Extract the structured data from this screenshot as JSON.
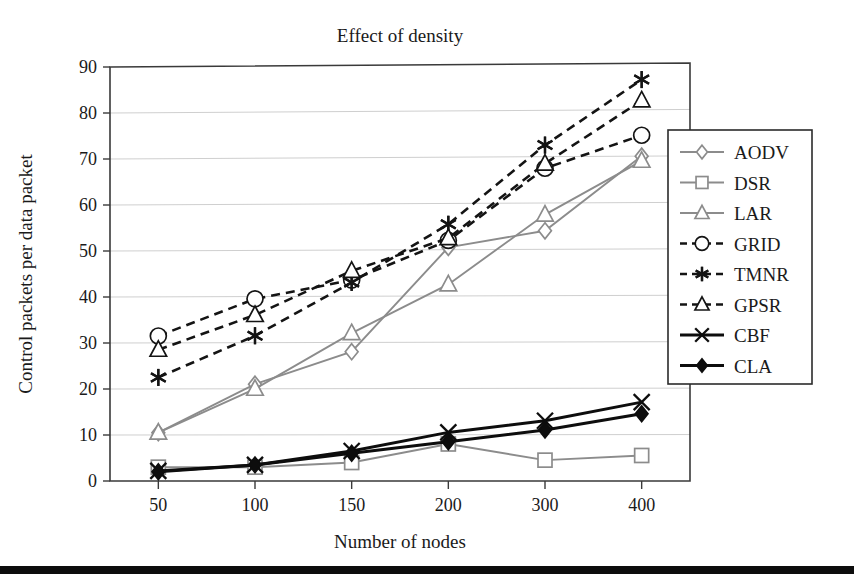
{
  "chart_data": {
    "type": "line",
    "title": "Effect of density",
    "xlabel": "Number of nodes",
    "ylabel": "Control packets per data packet",
    "categories": [
      "50",
      "100",
      "150",
      "200",
      "300",
      "400"
    ],
    "x": [
      50,
      100,
      150,
      200,
      300,
      400
    ],
    "ylim": [
      0,
      90
    ],
    "yticks": [
      "0",
      "10",
      "20",
      "30",
      "40",
      "50",
      "60",
      "70",
      "80",
      "90"
    ],
    "ytick_values": [
      0,
      10,
      20,
      30,
      40,
      50,
      60,
      70,
      80,
      90
    ],
    "grid": "horizontal",
    "legend_position": "right",
    "series": [
      {
        "name": "AODV",
        "values": [
          10.5,
          21.0,
          28.0,
          50.5,
          54.0,
          70.0
        ],
        "marker": "diamond-open",
        "line": "solid",
        "color": "#8c8c8c"
      },
      {
        "name": "DSR",
        "values": [
          3.0,
          3.0,
          4.0,
          8.0,
          4.5,
          5.5
        ],
        "marker": "square-open",
        "line": "solid",
        "color": "#8c8c8c"
      },
      {
        "name": "LAR",
        "values": [
          10.5,
          20.0,
          32.0,
          42.5,
          57.5,
          69.0
        ],
        "marker": "triangle-open",
        "line": "solid",
        "color": "#8c8c8c"
      },
      {
        "name": "GRID",
        "values": [
          31.5,
          39.5,
          43.5,
          52.0,
          67.5,
          74.5
        ],
        "marker": "circle-open",
        "line": "dashed",
        "color": "#141414"
      },
      {
        "name": "TMNR",
        "values": [
          22.5,
          31.5,
          43.0,
          55.5,
          72.5,
          86.5
        ],
        "marker": "asterisk",
        "line": "dashed",
        "color": "#141414"
      },
      {
        "name": "GPSR",
        "values": [
          28.5,
          36.0,
          45.5,
          52.5,
          68.5,
          82.0
        ],
        "marker": "triangle-open",
        "line": "dashed",
        "color": "#141414"
      },
      {
        "name": "CBF",
        "values": [
          2.2,
          3.5,
          6.5,
          10.5,
          13.0,
          17.0
        ],
        "marker": "x-cross",
        "line": "solid",
        "color": "#0d0d0d"
      },
      {
        "name": "CLA",
        "values": [
          2.0,
          3.5,
          6.0,
          8.5,
          11.0,
          14.5
        ],
        "marker": "diamond-filled",
        "line": "solid",
        "color": "#0d0d0d"
      }
    ]
  },
  "legend": {
    "items": [
      {
        "label": "AODV"
      },
      {
        "label": "DSR"
      },
      {
        "label": "LAR"
      },
      {
        "label": "GRID"
      },
      {
        "label": "TMNR"
      },
      {
        "label": "GPSR"
      },
      {
        "label": "CBF"
      },
      {
        "label": "CLA"
      }
    ]
  },
  "colors": {
    "gray_series": "#8c8c8c",
    "black_series": "#0d0d0d",
    "dashed_series": "#141414",
    "gridline": "#cfcfcf",
    "frame": "#3a3a3a",
    "text": "#1a1a1a"
  }
}
